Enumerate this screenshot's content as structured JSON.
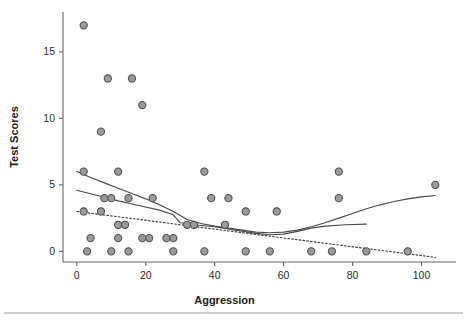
{
  "chart_data": {
    "type": "scatter",
    "title": "",
    "xlabel": "Aggression",
    "ylabel": "Test Scores",
    "xlim": [
      -4,
      110
    ],
    "ylim": [
      -0.8,
      18
    ],
    "grid": false,
    "legend": "none",
    "xticks": [
      0,
      20,
      40,
      60,
      80,
      100
    ],
    "xtick_labels": [
      "0",
      "20",
      "40",
      "60",
      "80",
      "100"
    ],
    "yticks": [
      0,
      5,
      10,
      15
    ],
    "ytick_labels": [
      "0",
      "5",
      "10",
      "15"
    ],
    "marker_fill": "#9a9a9a",
    "marker_edge": "#4d4d4d",
    "points": [
      {
        "x": 2,
        "y": 17
      },
      {
        "x": 9,
        "y": 13
      },
      {
        "x": 16,
        "y": 13
      },
      {
        "x": 19,
        "y": 11
      },
      {
        "x": 7,
        "y": 9
      },
      {
        "x": 2,
        "y": 6
      },
      {
        "x": 12,
        "y": 6
      },
      {
        "x": 37,
        "y": 6
      },
      {
        "x": 76,
        "y": 6
      },
      {
        "x": 104,
        "y": 5
      },
      {
        "x": 8,
        "y": 4
      },
      {
        "x": 10,
        "y": 4
      },
      {
        "x": 15,
        "y": 4
      },
      {
        "x": 22,
        "y": 4
      },
      {
        "x": 39,
        "y": 4
      },
      {
        "x": 44,
        "y": 4
      },
      {
        "x": 76,
        "y": 4
      },
      {
        "x": 2,
        "y": 3
      },
      {
        "x": 7,
        "y": 3
      },
      {
        "x": 49,
        "y": 3
      },
      {
        "x": 58,
        "y": 3
      },
      {
        "x": 12,
        "y": 2
      },
      {
        "x": 14,
        "y": 2
      },
      {
        "x": 32,
        "y": 2
      },
      {
        "x": 34,
        "y": 2
      },
      {
        "x": 43,
        "y": 2
      },
      {
        "x": 4,
        "y": 1
      },
      {
        "x": 12,
        "y": 1
      },
      {
        "x": 19,
        "y": 1
      },
      {
        "x": 21,
        "y": 1
      },
      {
        "x": 26,
        "y": 1
      },
      {
        "x": 28,
        "y": 1
      },
      {
        "x": 3,
        "y": 0
      },
      {
        "x": 10,
        "y": 0
      },
      {
        "x": 15,
        "y": 0
      },
      {
        "x": 28,
        "y": 0
      },
      {
        "x": 37,
        "y": 0
      },
      {
        "x": 49,
        "y": 0
      },
      {
        "x": 56,
        "y": 0
      },
      {
        "x": 68,
        "y": 0
      },
      {
        "x": 74,
        "y": 0
      },
      {
        "x": 84,
        "y": 0
      },
      {
        "x": 96,
        "y": 0
      }
    ],
    "fits": [
      {
        "name": "loess-curve",
        "style": "solid",
        "points": [
          [
            0,
            6.0
          ],
          [
            4,
            5.55
          ],
          [
            8,
            5.15
          ],
          [
            12,
            4.75
          ],
          [
            16,
            4.35
          ],
          [
            20,
            3.95
          ],
          [
            24,
            3.5
          ],
          [
            28,
            3.0
          ],
          [
            32,
            2.4
          ],
          [
            36,
            2.1
          ],
          [
            40,
            1.9
          ],
          [
            44,
            1.75
          ],
          [
            48,
            1.6
          ],
          [
            52,
            1.45
          ],
          [
            56,
            1.4
          ],
          [
            60,
            1.45
          ],
          [
            64,
            1.6
          ],
          [
            68,
            1.85
          ],
          [
            72,
            2.15
          ],
          [
            76,
            2.5
          ],
          [
            80,
            2.85
          ],
          [
            84,
            3.2
          ],
          [
            88,
            3.5
          ],
          [
            92,
            3.75
          ],
          [
            96,
            3.95
          ],
          [
            100,
            4.1
          ],
          [
            104,
            4.2
          ]
        ]
      },
      {
        "name": "piecewise-fit",
        "style": "solid",
        "points": [
          [
            0,
            4.6
          ],
          [
            6,
            4.2
          ],
          [
            12,
            3.8
          ],
          [
            18,
            3.45
          ],
          [
            24,
            3.1
          ],
          [
            28,
            2.75
          ],
          [
            30,
            2.15
          ],
          [
            34,
            2.0
          ],
          [
            40,
            1.85
          ],
          [
            46,
            1.6
          ],
          [
            52,
            1.35
          ],
          [
            56,
            1.25
          ],
          [
            60,
            1.3
          ],
          [
            64,
            1.5
          ],
          [
            68,
            1.75
          ],
          [
            72,
            1.9
          ],
          [
            78,
            2.0
          ],
          [
            84,
            2.05
          ]
        ]
      },
      {
        "name": "regression-dotted",
        "style": "dotted",
        "points": [
          [
            0,
            3.0
          ],
          [
            104,
            -0.45
          ]
        ]
      }
    ]
  },
  "footer": {
    "rule": true
  }
}
